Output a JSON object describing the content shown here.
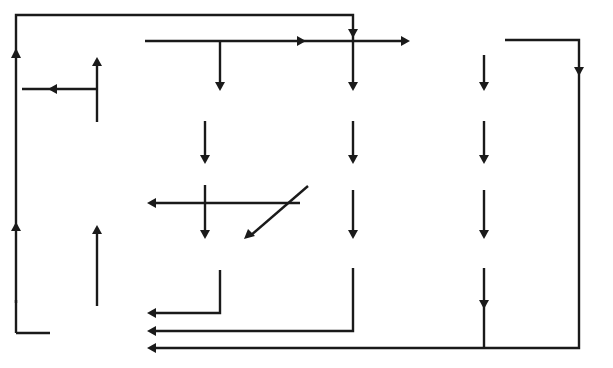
{
  "diagram": {
    "nodes": {
      "households": "Households",
      "consumption": "Consumption",
      "savings": "Savings",
      "savings_sym": "(S)",
      "taxes": "Taxes",
      "taxes_sym": "(T)",
      "imports": "Imports",
      "imports_sym": "(M)",
      "factor_incomes_1": "Factor",
      "factor_incomes_2": "incomes",
      "factor_items": [
        "Wages",
        "Interest",
        "Profit",
        "Rent"
      ],
      "financial_1": "Financial",
      "financial_2": "institutions",
      "public_sector_1": "Public",
      "public_sector_2": "sector",
      "overseas_1": "Overseas",
      "overseas_2": "market",
      "domestic_1": "Domestic",
      "domestic_2": "market",
      "investment": "Investment",
      "investment_sym": "(I)",
      "public_spending_1": "Public",
      "public_spending_2": "spending",
      "public_spending_sym": "(G)",
      "exports": "Exports",
      "exports_sym": "(X)",
      "firms": "FIRMS"
    },
    "labels": {
      "withdrawals": "WITHDRAWALS",
      "injections": "INJECTIONS",
      "income_taxes_1": "Income",
      "income_taxes_2": "taxes",
      "company_taxes_1": "Company",
      "company_taxes_2": "taxes",
      "grants": "Grants, subsidies, etc.",
      "sales_receipts": "Sales receipts"
    }
  }
}
